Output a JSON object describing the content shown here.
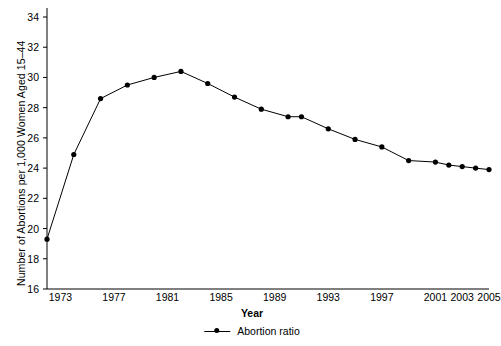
{
  "chart_data": {
    "type": "line",
    "title": "",
    "xlabel": "Year",
    "ylabel": "Number of Abortions per 1,000 Women Aged 15–44",
    "xlim": [
      1972,
      2005
    ],
    "ylim": [
      16,
      34
    ],
    "yticks": [
      16,
      18,
      20,
      22,
      24,
      26,
      28,
      30,
      32,
      34
    ],
    "xticks": [
      1973,
      1977,
      1981,
      1985,
      1989,
      1993,
      1997,
      2001,
      2003,
      2005
    ],
    "grid": false,
    "legend_position": "bottom",
    "marker": "filled-circle",
    "line_color": "#000000",
    "series": [
      {
        "name": "Abortion ratio",
        "x": [
          1972,
          1974,
          1976,
          1978,
          1980,
          1982,
          1984,
          1986,
          1988,
          1990,
          1991,
          1993,
          1995,
          1997,
          1999,
          2001,
          2002,
          2003,
          2004,
          2005
        ],
        "values": [
          19.3,
          24.9,
          28.6,
          29.5,
          30.0,
          30.4,
          29.6,
          28.7,
          27.9,
          27.4,
          27.4,
          26.6,
          25.9,
          25.4,
          24.5,
          24.4,
          24.2,
          24.1,
          24.0,
          23.9
        ]
      }
    ]
  },
  "legend": {
    "entries": [
      {
        "label": "Abortion ratio"
      }
    ]
  }
}
